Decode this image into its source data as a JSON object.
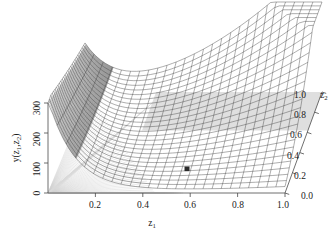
{
  "figure": {
    "kind": "3d-wireframe-surface-plot",
    "width": 336,
    "height": 238,
    "background_color": "#ffffff",
    "mesh_line_color": "#3a3a3a",
    "mesh_shadow_color": "#b8b8b8",
    "axis_color": "#555555",
    "marker_color": "#2b2b2b"
  },
  "axes": {
    "y": {
      "title": "y(z",
      "title_sub1": "1",
      "title_mid": ",z",
      "title_sub2": "2",
      "title_end": ")",
      "title_full": "y(z1,z2)",
      "ticks": [
        "0",
        "100",
        "200",
        "300"
      ],
      "min": 0,
      "max": 300
    },
    "x": {
      "title": "z",
      "title_sub": "1",
      "title_full": "z1",
      "ticks": [
        "0.2",
        "0.4",
        "0.6",
        "0.8",
        "1.0"
      ],
      "min": 0,
      "max": 1.0
    },
    "z": {
      "title": "z",
      "title_sub": "2",
      "title_full": "z2",
      "ticks": [
        "0.0",
        "0.2",
        "0.4",
        "0.6",
        "0.8",
        "1.0"
      ],
      "min": 0,
      "max": 1.0
    }
  },
  "marker": {
    "label": "optimum-point",
    "z1": 0.56,
    "z2": 0.17,
    "y": 40
  },
  "chart_data": {
    "type": "surface",
    "title": "",
    "xlabel": "z1",
    "ylabel": "y(z1,z2)",
    "zlabel": "z2",
    "xlim": [
      0,
      1.0
    ],
    "zlim": [
      0,
      1.0
    ],
    "ylim": [
      0,
      300
    ],
    "grid": false,
    "legend": "none",
    "x_ticks": [
      0.2,
      0.4,
      0.6,
      0.8,
      1.0
    ],
    "z_ticks": [
      0.0,
      0.2,
      0.4,
      0.6,
      0.8,
      1.0
    ],
    "y_ticks": [
      0,
      100,
      200,
      300
    ],
    "mesh_nx": 26,
    "mesh_nz": 26,
    "surface_samples": {
      "z1": [
        0.0,
        0.2,
        0.4,
        0.6,
        0.8,
        1.0
      ],
      "z2": [
        0.0,
        0.2,
        0.4,
        0.6,
        0.8,
        1.0
      ],
      "y": [
        [
          300,
          250,
          205,
          175,
          160,
          155
        ],
        [
          95,
          80,
          75,
          85,
          110,
          140
        ],
        [
          25,
          20,
          30,
          60,
          110,
          175
        ],
        [
          10,
          18,
          45,
          95,
          165,
          235
        ],
        [
          20,
          40,
          85,
          150,
          230,
          290
        ],
        [
          45,
          80,
          140,
          215,
          290,
          300
        ]
      ]
    }
  }
}
